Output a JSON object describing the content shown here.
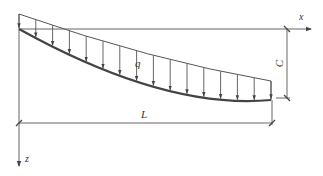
{
  "diagram": {
    "type": "beam-deflection-distributed-load",
    "labels": {
      "x_axis": "x",
      "z_axis": "z",
      "load": "q",
      "span": "L",
      "deflection": "C"
    },
    "colors": {
      "line": "#555555",
      "beam": "#444444",
      "text": "#333333",
      "background": "#ffffff"
    },
    "geometry": {
      "origin": [
        19,
        29
      ],
      "x_axis_end": [
        311,
        29
      ],
      "z_axis_end": [
        19,
        166
      ],
      "beam_end": [
        271,
        100
      ],
      "load_start": [
        19,
        14
      ],
      "load_end": [
        271,
        81
      ],
      "span_dim_y": 123,
      "deflection_dim_x": 287,
      "arrow_count": 16
    }
  }
}
